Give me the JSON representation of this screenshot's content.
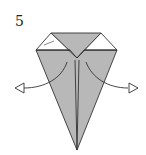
{
  "diagram": {
    "type": "origami-instruction",
    "step_number": "5",
    "colors": {
      "paper_shaded": "#b8b8b8",
      "paper_white": "#ffffff",
      "line": "#333333"
    },
    "arrows": [
      {
        "name": "unfold-left-arrow",
        "direction": "left"
      },
      {
        "name": "unfold-right-arrow",
        "direction": "right"
      }
    ]
  }
}
